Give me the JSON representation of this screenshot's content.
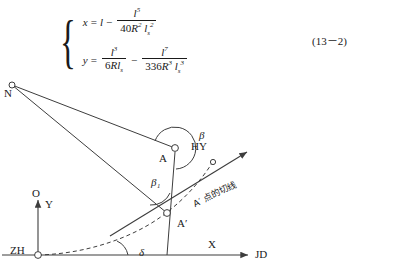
{
  "figure": {
    "equation_number": "(13－2)",
    "equations": [
      {
        "id": "eq-x",
        "lhs": "x",
        "rel": "=",
        "terms": [
          "l",
          "−",
          "l⁵ / (40R²l_s²)"
        ],
        "plain": "x = l − l^5 / (40 R^2 l_s^2)",
        "parts": {
          "lhs": "x",
          "eq": "=",
          "first": "l",
          "minus": "−",
          "num": "l",
          "num_sup": "5",
          "den_coef": "40",
          "den_R": "R",
          "den_R_sup": "2",
          "den_l": "l",
          "den_l_sub": "s",
          "den_l_sup": "2"
        }
      },
      {
        "id": "eq-y",
        "lhs": "y",
        "rel": "=",
        "terms": [
          "l³ / (6Rl_s)",
          "−",
          "l⁷ / (336R³l_s³)"
        ],
        "plain": "y = l^3 / (6 R l_s) − l^7 / (336 R^3 l_s^3)",
        "parts": {
          "lhs": "y",
          "eq": "=",
          "num1": "l",
          "num1_sup": "3",
          "den1_coef": "6",
          "den1_R": "R",
          "den1_l": "l",
          "den1_l_sub": "s",
          "minus": "−",
          "num2": "l",
          "num2_sup": "7",
          "den2_coef": "336",
          "den2_R": "R",
          "den2_R_sup": "3",
          "den2_l": "l",
          "den2_l_sub": "s",
          "den2_l_sup": "3"
        }
      }
    ],
    "points": [
      {
        "name": "N",
        "label": "N",
        "x": 12,
        "y": 85,
        "label_x": 4,
        "label_y": 90
      },
      {
        "name": "A",
        "label": "A",
        "x": 175,
        "y": 148,
        "label_x": 160,
        "label_y": 158
      },
      {
        "name": "A-prime",
        "label": "A′",
        "x": 167,
        "y": 213,
        "label_x": 176,
        "label_y": 224
      },
      {
        "name": "HY",
        "label": "HY",
        "x": 212,
        "y": 163,
        "label_x": 192,
        "label_y": 146
      },
      {
        "name": "ZH",
        "label": "ZH",
        "x": 38,
        "y": 255,
        "label_x": 10,
        "label_y": 250
      },
      {
        "name": "O",
        "label": "O",
        "x": 38,
        "y": 255,
        "label_x": 33,
        "label_y": 193
      },
      {
        "name": "JD",
        "label": "JD",
        "x": 252,
        "y": 255,
        "label_x": 256,
        "label_y": 252
      }
    ],
    "axes": {
      "x_label": "X",
      "y_label": "Y",
      "origin_label": "O",
      "x_end_label": "JD",
      "start_label": "ZH"
    },
    "angles": [
      {
        "name": "beta",
        "label": "β",
        "vertex": "A",
        "label_x": 200,
        "label_y": 136
      },
      {
        "name": "beta-1",
        "label": "β₁",
        "vertex": "A′",
        "label_x": 152,
        "label_y": 183
      },
      {
        "name": "delta",
        "label": "δ",
        "vertex": "O",
        "label_x": 140,
        "label_y": 252
      }
    ],
    "annotations": [
      {
        "name": "tangent-note",
        "text": "A′ 点的切线",
        "x": 196,
        "y": 196,
        "rotation": -26
      }
    ],
    "colors": {
      "line": "#3d3d3d",
      "dashed_curve": "#3d3d3d",
      "text": "#1a1a1a",
      "background": "#ffffff"
    }
  }
}
